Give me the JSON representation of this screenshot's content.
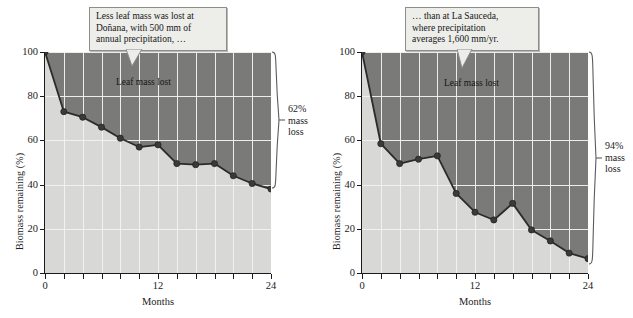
{
  "figure": {
    "panels": [
      {
        "id": "donana",
        "callout": {
          "lines": [
            "Less leaf mass was lost at",
            "Doñana, with 500 mm of",
            "annual precipitation, …"
          ]
        },
        "inplot_label": "Leaf mass lost",
        "brace": {
          "lines": [
            "62%",
            "mass",
            "loss"
          ]
        },
        "chart_data": {
          "type": "line",
          "title": "",
          "xlabel": "Months",
          "ylabel": "Biomass remaining (%)",
          "x": [
            0,
            2,
            4,
            6,
            8,
            10,
            12,
            14,
            16,
            18,
            20,
            22,
            24
          ],
          "values": [
            100,
            73,
            70.5,
            66,
            61,
            57,
            58,
            49.5,
            49,
            49.5,
            44,
            40.5,
            38
          ],
          "xlim": [
            0,
            24
          ],
          "ylim": [
            0,
            100
          ],
          "xticks": [
            0,
            12,
            24
          ],
          "xtick_labels": [
            "0",
            "12",
            "24"
          ],
          "xminor": [
            2,
            4,
            6,
            8,
            10,
            14,
            16,
            18,
            20,
            22
          ],
          "yticks": [
            0,
            20,
            40,
            60,
            80,
            100
          ],
          "ytick_labels": [
            "0",
            "20",
            "40",
            "60",
            "80",
            "100"
          ],
          "grid": true,
          "legend": "none",
          "area_below_label": "Biomass remaining",
          "area_above_label": "Leaf mass lost",
          "mass_loss_percent": 62
        }
      },
      {
        "id": "la-sauceda",
        "callout": {
          "lines": [
            "… than at La Sauceda,",
            "where precipitation",
            "averages 1,600 mm/yr."
          ]
        },
        "inplot_label": "Leaf mass lost",
        "brace": {
          "lines": [
            "94%",
            "mass",
            "loss"
          ]
        },
        "chart_data": {
          "type": "line",
          "title": "",
          "xlabel": "Months",
          "ylabel": "Biomass remaining (%)",
          "x": [
            0,
            2,
            4,
            6,
            8,
            10,
            12,
            14,
            16,
            18,
            20,
            22,
            24
          ],
          "values": [
            100,
            58.5,
            49.5,
            51.5,
            53,
            36,
            27.5,
            24,
            31.5,
            19.5,
            14.5,
            9,
            6.5
          ],
          "xlim": [
            0,
            24
          ],
          "ylim": [
            0,
            100
          ],
          "xticks": [
            0,
            12,
            24
          ],
          "xtick_labels": [
            "0",
            "12",
            "24"
          ],
          "xminor": [
            2,
            4,
            6,
            8,
            10,
            14,
            16,
            18,
            20,
            22
          ],
          "yticks": [
            0,
            20,
            40,
            60,
            80,
            100
          ],
          "ytick_labels": [
            "0",
            "20",
            "40",
            "60",
            "80",
            "100"
          ],
          "grid": true,
          "legend": "none",
          "area_below_label": "Biomass remaining",
          "area_above_label": "Leaf mass lost",
          "mass_loss_percent": 94
        }
      }
    ],
    "colors": {
      "area_remaining": "#d8d8d6",
      "area_lost": "#7a7a78",
      "line": "#2b2b2b",
      "marker": "#3a3a38",
      "gridline": "#f2f2ee",
      "axis": "#1b1b1b",
      "callout_bg": "#ededea",
      "callout_border": "#8d8d8a"
    }
  }
}
